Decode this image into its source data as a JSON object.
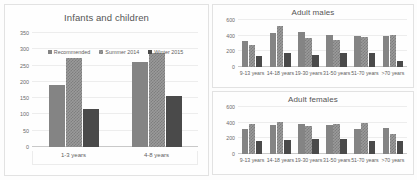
{
  "figure": {
    "palette": {
      "series_1": "#848484",
      "series_2": "#9a9a9a",
      "series_3": "#4a4a4a",
      "grid": "#ededed",
      "axis": "#c9c9c9",
      "text": "#5e5e5e"
    }
  },
  "legend": {
    "items": [
      {
        "label": "Recommended"
      },
      {
        "label": "Summer 2014"
      },
      {
        "label": "Winter 2015"
      }
    ]
  },
  "chart_data": [
    {
      "type": "bar",
      "title": "Infants and children",
      "xlabel": "",
      "ylabel": "",
      "ylim": [
        0,
        350
      ],
      "yticks": [
        0,
        50,
        100,
        150,
        200,
        250,
        300,
        350
      ],
      "grid": true,
      "legend_position": "top-center",
      "categories": [
        "1-3 years",
        "4-8 years"
      ],
      "series": [
        {
          "name": "Recommended",
          "values": [
            190,
            260
          ]
        },
        {
          "name": "Summer 2014",
          "values": [
            272,
            290
          ]
        },
        {
          "name": "Winter 2015",
          "values": [
            117,
            157
          ]
        }
      ]
    },
    {
      "type": "bar",
      "title": "Adult males",
      "xlabel": "",
      "ylabel": "",
      "ylim": [
        0,
        600
      ],
      "yticks": [
        0,
        200,
        400,
        600
      ],
      "grid": true,
      "legend_position": "none",
      "categories": [
        "9-13 years",
        "14-18 years",
        "19-30 years",
        "31-50 years",
        "51-70 years",
        ">70 years"
      ],
      "series": [
        {
          "name": "Recommended",
          "values": [
            330,
            440,
            450,
            415,
            395,
            395
          ]
        },
        {
          "name": "Summer 2014",
          "values": [
            275,
            520,
            365,
            345,
            385,
            415
          ]
        },
        {
          "name": "Winter 2015",
          "values": [
            140,
            185,
            150,
            175,
            180,
            75
          ]
        }
      ]
    },
    {
      "type": "bar",
      "title": "Adult females",
      "xlabel": "",
      "ylabel": "",
      "ylim": [
        0,
        600
      ],
      "yticks": [
        0,
        200,
        400,
        600
      ],
      "grid": true,
      "legend_position": "none",
      "categories": [
        "9-13 years",
        "14-18 years",
        "19-30 years",
        "31-50 years",
        "51-70 years",
        ">70 years"
      ],
      "series": [
        {
          "name": "Recommended",
          "values": [
            325,
            370,
            385,
            370,
            320,
            330
          ]
        },
        {
          "name": "Summer 2014",
          "values": [
            385,
            410,
            355,
            380,
            390,
            250
          ]
        },
        {
          "name": "Winter 2015",
          "values": [
            165,
            185,
            195,
            190,
            170,
            165
          ]
        }
      ]
    }
  ]
}
